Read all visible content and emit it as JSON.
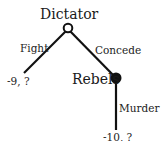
{
  "diagram": {
    "type": "game-tree",
    "colors": {
      "line": "#111111",
      "text": "#222222",
      "background": "#ffffff"
    },
    "nodes": [
      {
        "id": "dictator",
        "label": "Dictator",
        "style": "hollow"
      },
      {
        "id": "rebels",
        "label": "Rebels",
        "style": "filled"
      }
    ],
    "edges": [
      {
        "from": "dictator",
        "label": "Fight",
        "payoff": "-9, ?"
      },
      {
        "from": "dictator",
        "to": "rebels",
        "label": "Concede"
      },
      {
        "from": "rebels",
        "label": "Murder",
        "payoff": "-10, ?"
      }
    ]
  }
}
